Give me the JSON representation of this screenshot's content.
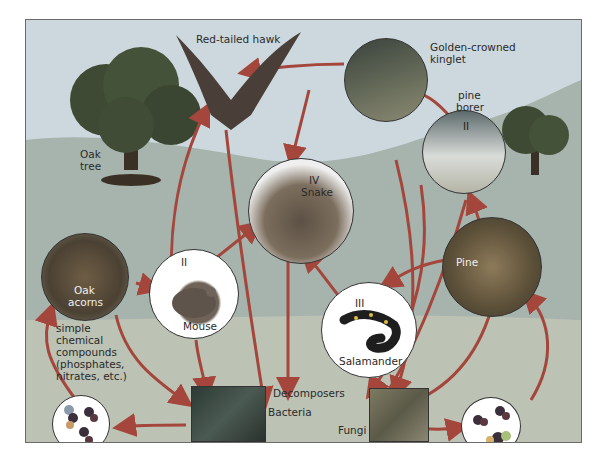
{
  "colors": {
    "sky": "#cdd8de",
    "hill": "#a6b4ad",
    "ground": "#c6c8b6",
    "arrow": "#a4463c",
    "frame": "#6a6a6a"
  },
  "labels": {
    "hawk": "Red-tailed hawk",
    "kinglet_1": "Golden-crowned",
    "kinglet_2": "kinglet",
    "pine_borer_1": "pine",
    "pine_borer_2": "borer",
    "pine_borer_level": "II",
    "oak_tree_1": "Oak",
    "oak_tree_2": "tree",
    "snake_level": "IV",
    "snake": "Snake",
    "oak_acorns_1": "Oak",
    "oak_acorns_2": "acorns",
    "mouse_level": "II",
    "mouse": "Mouse",
    "pine": "Pine",
    "salamander_level": "III",
    "salamander": "Salamander",
    "compounds_1": "simple",
    "compounds_2": "chemical",
    "compounds_3": "compounds",
    "compounds_4": "(phosphates,",
    "compounds_5": "nitrates, etc.)",
    "decomposers": "Decomposers",
    "bacteria": "Bacteria",
    "fungi": "Fungi"
  },
  "organisms": [
    {
      "name": "Red-tailed hawk",
      "icon": "hawk-icon"
    },
    {
      "name": "Golden-crowned kinglet",
      "icon": "kinglet-icon"
    },
    {
      "name": "Pine borer",
      "icon": "beetle-icon",
      "level": "II"
    },
    {
      "name": "Oak tree",
      "icon": "oak-tree-icon"
    },
    {
      "name": "Snake",
      "icon": "snake-icon",
      "level": "IV"
    },
    {
      "name": "Oak acorns",
      "icon": "acorns-icon"
    },
    {
      "name": "Mouse",
      "icon": "mouse-icon",
      "level": "II"
    },
    {
      "name": "Pine",
      "icon": "pine-cone-icon"
    },
    {
      "name": "Salamander",
      "icon": "salamander-icon",
      "level": "III"
    },
    {
      "name": "Bacteria",
      "icon": "bacteria-icon"
    },
    {
      "name": "Fungi",
      "icon": "fungi-icon"
    },
    {
      "name": "simple chemical compounds",
      "icon": "molecule-icon"
    }
  ]
}
